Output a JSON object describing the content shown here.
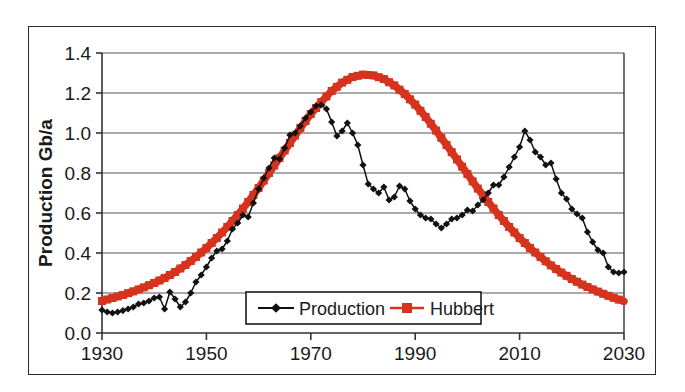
{
  "chart_data": {
    "type": "line",
    "title": "",
    "xlabel": "",
    "ylabel": "Production Gb/a",
    "xlim": [
      1930,
      2030
    ],
    "ylim": [
      0.0,
      1.4
    ],
    "grid": true,
    "legend_position": "inside-bottom-center",
    "x_ticks": [
      "1930",
      "1950",
      "1970",
      "1990",
      "2010",
      "2030"
    ],
    "x_tick_values": [
      1930,
      1950,
      1970,
      1990,
      2010,
      2030
    ],
    "y_ticks": [
      "0.0",
      "0.2",
      "0.4",
      "0.6",
      "0.8",
      "1.0",
      "1.2",
      "1.4"
    ],
    "y_tick_values": [
      0.0,
      0.2,
      0.4,
      0.6,
      0.8,
      1.0,
      1.2,
      1.4
    ],
    "colors": {
      "production": "#111111",
      "hubbert": "#D6331F",
      "axis": "#333333",
      "grid": "#555555",
      "frame": "#2a2a2a"
    },
    "series": [
      {
        "name": "Production",
        "marker": "diamond",
        "color": "#111111",
        "x": [
          1930,
          1931,
          1932,
          1933,
          1934,
          1935,
          1936,
          1937,
          1938,
          1939,
          1940,
          1941,
          1942,
          1943,
          1944,
          1945,
          1946,
          1947,
          1948,
          1949,
          1950,
          1951,
          1952,
          1953,
          1954,
          1955,
          1956,
          1957,
          1958,
          1959,
          1960,
          1961,
          1962,
          1963,
          1964,
          1965,
          1966,
          1967,
          1968,
          1969,
          1970,
          1971,
          1972,
          1973,
          1974,
          1975,
          1976,
          1977,
          1978,
          1979,
          1980,
          1981,
          1982,
          1983,
          1984,
          1985,
          1986,
          1987,
          1988,
          1989,
          1990,
          1991,
          1992,
          1993,
          1994,
          1995,
          1996,
          1997,
          1998,
          1999,
          2000,
          2001,
          2002,
          2003,
          2004,
          2005,
          2006,
          2007,
          2008,
          2009,
          2010,
          2011,
          2012,
          2013,
          2014,
          2015,
          2016,
          2017,
          2018,
          2019,
          2020,
          2021,
          2022,
          2023,
          2024,
          2025,
          2026,
          2027,
          2028,
          2029,
          2030
        ],
        "y": [
          0.115,
          0.105,
          0.1,
          0.105,
          0.112,
          0.12,
          0.13,
          0.145,
          0.15,
          0.16,
          0.175,
          0.18,
          0.12,
          0.205,
          0.17,
          0.13,
          0.155,
          0.2,
          0.255,
          0.29,
          0.33,
          0.375,
          0.41,
          0.42,
          0.46,
          0.52,
          0.55,
          0.59,
          0.58,
          0.65,
          0.72,
          0.775,
          0.825,
          0.875,
          0.87,
          0.925,
          0.99,
          1.0,
          1.035,
          1.075,
          1.105,
          1.135,
          1.14,
          1.12,
          1.055,
          0.985,
          1.01,
          1.05,
          1.0,
          0.94,
          0.84,
          0.745,
          0.72,
          0.7,
          0.73,
          0.665,
          0.68,
          0.735,
          0.72,
          0.66,
          0.62,
          0.59,
          0.575,
          0.57,
          0.545,
          0.525,
          0.545,
          0.57,
          0.575,
          0.59,
          0.615,
          0.61,
          0.64,
          0.665,
          0.7,
          0.74,
          0.74,
          0.78,
          0.83,
          0.88,
          0.93,
          1.01,
          0.965,
          0.905,
          0.88,
          0.84,
          0.85,
          0.77,
          0.7,
          0.67,
          0.62,
          0.595,
          0.575,
          0.505,
          0.455,
          0.415,
          0.4,
          0.33,
          0.305,
          0.3,
          0.305
        ]
      },
      {
        "name": "Hubbert",
        "marker": "square",
        "color": "#D6331F",
        "curve_note": "Logistic/Hubbert bell curve peaking at approximately 1.29 Gb/a around 1980",
        "peak_year": 1980,
        "peak_value": 1.29,
        "x": [
          1930,
          1932,
          1934,
          1936,
          1938,
          1940,
          1942,
          1944,
          1946,
          1948,
          1950,
          1952,
          1954,
          1956,
          1958,
          1960,
          1962,
          1964,
          1966,
          1968,
          1970,
          1972,
          1974,
          1976,
          1978,
          1980,
          1982,
          1984,
          1986,
          1988,
          1990,
          1992,
          1994,
          1996,
          1998,
          2000,
          2002,
          2004,
          2006,
          2008,
          2010,
          2012,
          2014,
          2016,
          2018,
          2020,
          2022,
          2024,
          2026,
          2028,
          2030
        ],
        "y": [
          0.16,
          0.175,
          0.19,
          0.208,
          0.228,
          0.25,
          0.275,
          0.305,
          0.34,
          0.38,
          0.425,
          0.475,
          0.53,
          0.59,
          0.655,
          0.725,
          0.8,
          0.875,
          0.95,
          1.025,
          1.095,
          1.155,
          1.21,
          1.252,
          1.28,
          1.292,
          1.288,
          1.27,
          1.238,
          1.195,
          1.142,
          1.08,
          1.012,
          0.94,
          0.868,
          0.795,
          0.722,
          0.655,
          0.59,
          0.53,
          0.475,
          0.425,
          0.38,
          0.338,
          0.302,
          0.27,
          0.242,
          0.218,
          0.196,
          0.176,
          0.158
        ]
      }
    ]
  },
  "legend": {
    "items": [
      {
        "label": "Production",
        "color": "#111111",
        "marker": "diamond"
      },
      {
        "label": "Hubbert",
        "color": "#D6331F",
        "marker": "square"
      }
    ]
  },
  "axes": {
    "y_title": "Production Gb/a"
  }
}
